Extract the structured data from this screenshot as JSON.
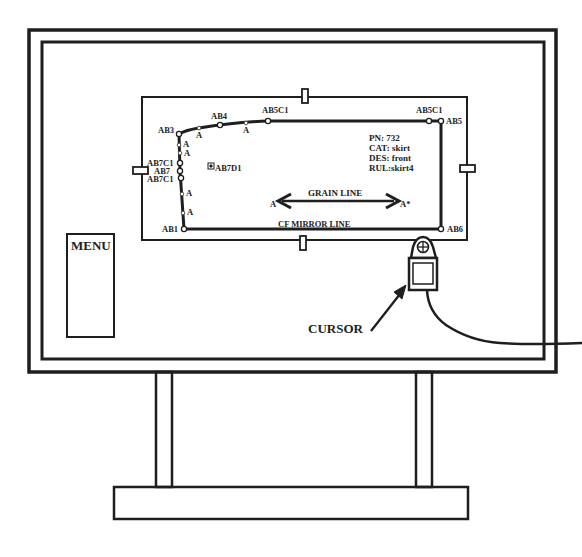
{
  "colors": {
    "ink": "#1e1e1e",
    "paper": "#ffffff",
    "point": "#555555"
  },
  "digitizer": {
    "menu_label": "MENU",
    "cursor_label": "CURSOR",
    "pattern": {
      "info": {
        "pn": "PN:   732",
        "cat": "CAT: skirt",
        "des": "DES: front",
        "rul": "RUL:skirt4"
      },
      "grain_line_label": "GRAIN LINE",
      "grain_start_label": "A",
      "grain_end_label": "A*",
      "mirror_line_label": "CF MIRROR LINE",
      "internal_point_label": "AB7D1",
      "points": [
        {
          "label": "AB3",
          "x": 179,
          "y": 134,
          "lx": 158,
          "ly": 133
        },
        {
          "label": "AB4",
          "x": 220,
          "y": 125,
          "lx": 211,
          "ly": 119
        },
        {
          "label": "AB5C1",
          "x": 268,
          "y": 121,
          "lx": 262,
          "ly": 113
        },
        {
          "label": "AB5C1",
          "x": 429,
          "y": 121,
          "lx": 416,
          "ly": 113
        },
        {
          "label": "AB5",
          "x": 441,
          "y": 121,
          "lx": 446,
          "ly": 124
        },
        {
          "label": "AB6",
          "x": 441,
          "y": 229,
          "lx": 447,
          "ly": 232
        },
        {
          "label": "AB1",
          "x": 184,
          "y": 229,
          "lx": 162,
          "ly": 232
        },
        {
          "label": "AB7C1",
          "x": 180,
          "y": 163,
          "lx": 147,
          "ly": 166
        },
        {
          "label": "AB7",
          "x": 180,
          "y": 171,
          "lx": 154,
          "ly": 174
        },
        {
          "label": "AB7C1",
          "x": 181,
          "y": 178,
          "lx": 147,
          "ly": 182
        }
      ],
      "a_marks": [
        {
          "label": "A",
          "x": 199,
          "y": 128,
          "lx": 196,
          "ly": 138
        },
        {
          "label": "A",
          "x": 246,
          "y": 123,
          "lx": 243,
          "ly": 133
        },
        {
          "label": "A",
          "x": 179,
          "y": 145,
          "lx": 183,
          "ly": 147
        },
        {
          "label": "A",
          "x": 180,
          "y": 153,
          "lx": 184,
          "ly": 156
        },
        {
          "label": "A",
          "x": 182,
          "y": 194,
          "lx": 186,
          "ly": 196
        },
        {
          "label": "A",
          "x": 183,
          "y": 213,
          "lx": 187,
          "ly": 215
        }
      ]
    }
  }
}
